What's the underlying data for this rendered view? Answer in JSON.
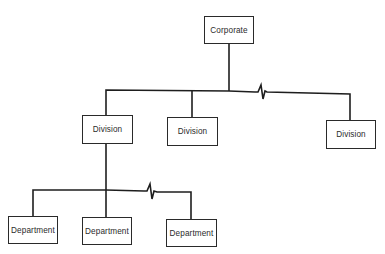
{
  "diagram": {
    "type": "organization-chart",
    "colors": {
      "line": "#1e1e1e",
      "box_border": "#2a2a2a",
      "text": "#2b2b2b",
      "background": "#ffffff"
    },
    "nodes": {
      "corporate": {
        "label": "Corporate"
      },
      "divisions": [
        {
          "label": "Division"
        },
        {
          "label": "Division"
        },
        {
          "label": "Division"
        }
      ],
      "departments": [
        {
          "label": "Department"
        },
        {
          "label": "Department"
        },
        {
          "label": "Department"
        }
      ]
    },
    "connectors": {
      "division_bus_break": "zigzag (omitted intermediate divisions)",
      "department_bus_break": "zigzag (omitted intermediate departments)"
    }
  }
}
